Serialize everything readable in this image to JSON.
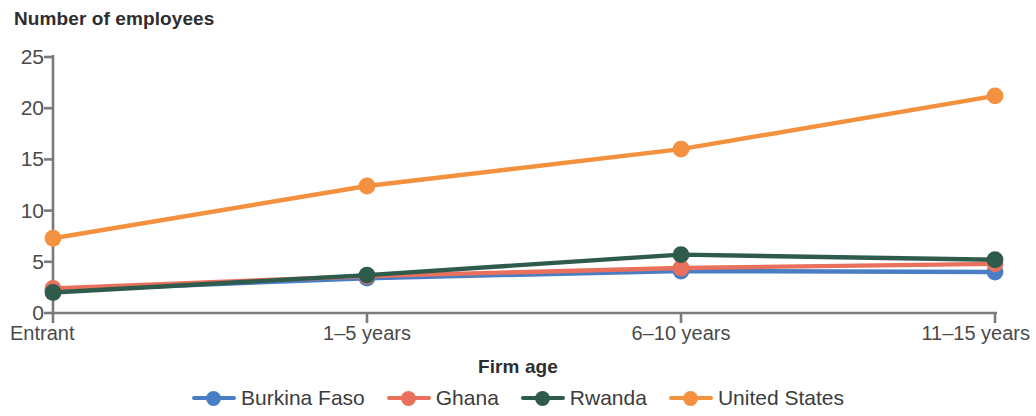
{
  "chart_data": {
    "type": "line",
    "title": "Number of employees",
    "xlabel": "Firm age",
    "ylabel": "",
    "categories": [
      "Entrant",
      "1–5 years",
      "6–10 years",
      "11–15 years"
    ],
    "yticks": [
      0,
      5,
      10,
      15,
      20,
      25
    ],
    "ylim": [
      0,
      25
    ],
    "grid": false,
    "legend_position": "bottom",
    "series": [
      {
        "name": "Burkina Faso",
        "color": "#4a7ec4",
        "values": [
          2.2,
          3.4,
          4.1,
          4.0
        ]
      },
      {
        "name": "Ghana",
        "color": "#e8705c",
        "values": [
          2.4,
          3.6,
          4.4,
          4.8
        ]
      },
      {
        "name": "Rwanda",
        "color": "#2f5b4c",
        "values": [
          2.0,
          3.7,
          5.7,
          5.2
        ]
      },
      {
        "name": "United States",
        "color": "#f4913e",
        "values": [
          7.3,
          12.4,
          16.0,
          21.2
        ]
      }
    ]
  },
  "axis": {
    "y_tick_labels": [
      "0",
      "5",
      "10",
      "15",
      "20",
      "25"
    ],
    "x_tick_labels": [
      "Entrant",
      "1–5 years",
      "6–10 years",
      "11–15 years"
    ]
  },
  "colors": {
    "axis": "#7a7a7a",
    "text": "#3c3c3c",
    "background": "#ffffff"
  }
}
